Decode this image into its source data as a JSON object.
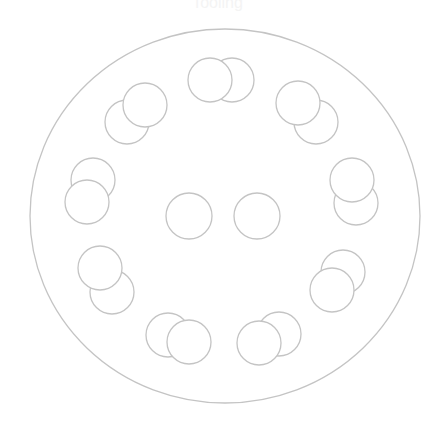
{
  "title": "Tooling",
  "colors": {
    "stroke": "#c4c4c4",
    "fill": "#ffffff",
    "background": "#ffffff"
  },
  "outer": {
    "cx": 225,
    "cy": 216,
    "rx": 195,
    "ry": 187
  },
  "circle_radius": 22,
  "pairs": [
    {
      "name": "top",
      "back": [
        232,
        80
      ],
      "front": [
        210,
        80
      ]
    },
    {
      "name": "top-right",
      "back": [
        316,
        122
      ],
      "front": [
        298,
        103
      ]
    },
    {
      "name": "right",
      "back": [
        356,
        203
      ],
      "front": [
        352,
        180
      ]
    },
    {
      "name": "lower-right",
      "back": [
        343,
        272
      ],
      "front": [
        332,
        290
      ]
    },
    {
      "name": "bottom-right",
      "back": [
        279,
        334
      ],
      "front": [
        259,
        343
      ]
    },
    {
      "name": "bottom-left",
      "back": [
        168,
        335
      ],
      "front": [
        189,
        342
      ]
    },
    {
      "name": "lower-left",
      "back": [
        112,
        292
      ],
      "front": [
        100,
        268
      ]
    },
    {
      "name": "left",
      "back": [
        93,
        180
      ],
      "front": [
        87,
        202
      ]
    },
    {
      "name": "top-left",
      "back": [
        127,
        122
      ],
      "front": [
        145,
        105
      ]
    }
  ],
  "center_circles": [
    [
      189,
      216
    ],
    [
      257,
      216
    ]
  ]
}
